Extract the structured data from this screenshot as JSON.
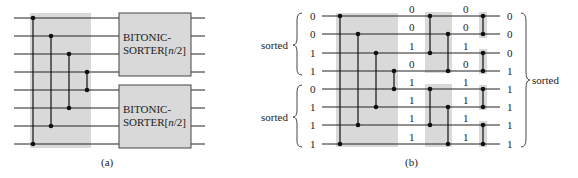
{
  "panel_a": {
    "caption": "(a)",
    "wire_count": 8,
    "half_cleaner_comparators": [
      [
        0,
        7
      ],
      [
        1,
        6
      ],
      [
        2,
        5
      ],
      [
        3,
        4
      ]
    ],
    "boxes": [
      {
        "line1": "BITONIC-",
        "line2_prefix": "SORTER[",
        "line2_var": "n",
        "line2_suffix": "/2]"
      },
      {
        "line1": "BITONIC-",
        "line2_prefix": "SORTER[",
        "line2_var": "n",
        "line2_suffix": "/2]"
      }
    ]
  },
  "panel_b": {
    "caption": "(b)",
    "inputs": [
      "0",
      "0",
      "1",
      "1",
      "0",
      "1",
      "1",
      "1"
    ],
    "after_stage1": [
      "0",
      "0",
      "1",
      "0",
      "1",
      "1",
      "1",
      "1"
    ],
    "after_stage2": [
      "0",
      "0",
      "1",
      "0",
      "1",
      "1",
      "1",
      "1"
    ],
    "outputs": [
      "0",
      "0",
      "0",
      "1",
      "1",
      "1",
      "1",
      "1"
    ],
    "left_brace_labels": [
      "sorted",
      "sorted"
    ],
    "right_brace_label": "sorted",
    "stage1_comparators": [
      [
        0,
        7
      ],
      [
        1,
        6
      ],
      [
        2,
        5
      ],
      [
        3,
        4
      ]
    ],
    "stage2_comparators": [
      [
        0,
        2
      ],
      [
        1,
        3
      ],
      [
        4,
        6
      ],
      [
        5,
        7
      ]
    ],
    "stage3_comparators": [
      [
        0,
        1
      ],
      [
        2,
        3
      ],
      [
        4,
        5
      ],
      [
        6,
        7
      ]
    ]
  },
  "colors": {
    "shade": "#d9d9d9",
    "line": "#222222"
  }
}
